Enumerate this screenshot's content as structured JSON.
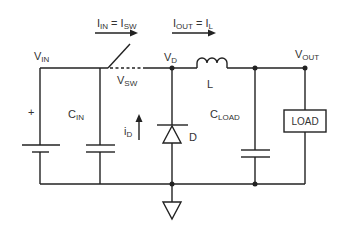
{
  "diagram": {
    "type": "buck-converter-schematic",
    "labels": {
      "vin": {
        "main": "V",
        "sub": "IN"
      },
      "vsw": {
        "main": "V",
        "sub": "SW"
      },
      "vd": {
        "main": "V",
        "sub": "D"
      },
      "vout": {
        "main": "V",
        "sub": "OUT"
      },
      "cin": {
        "main": "C",
        "sub": "IN"
      },
      "cload": {
        "main": "C",
        "sub": "LOAD"
      },
      "inductor": "L",
      "diode": "D",
      "id": {
        "main": "i",
        "sub": "D"
      },
      "battery_plus": "+",
      "load_box": "LOAD",
      "i_in_eq": {
        "a_main": "I",
        "a_sub": "IN",
        "eq": " = ",
        "b_main": "I",
        "b_sub": "SW"
      },
      "i_out_eq": {
        "a_main": "I",
        "a_sub": "OUT",
        "eq": " = ",
        "b_main": "I",
        "b_sub": "L"
      }
    },
    "components": [
      "battery",
      "C_IN",
      "switch",
      "diode D",
      "inductor L",
      "C_LOAD",
      "LOAD",
      "ground"
    ],
    "colors": {
      "line": "#222222",
      "text": "#333333",
      "background": "#ffffff"
    }
  }
}
